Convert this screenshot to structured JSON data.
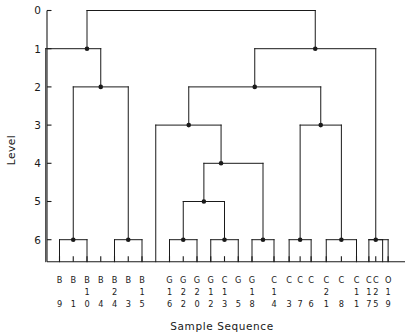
{
  "chart_data": {
    "type": "tree",
    "title": "",
    "xlabel": "Sample Sequence",
    "ylabel": "Level",
    "ylim": [
      0,
      6.6
    ],
    "y_ticks": [
      "0",
      "1",
      "2",
      "3",
      "4",
      "5",
      "6"
    ],
    "y_tick_values": [
      0,
      1,
      2,
      3,
      4,
      5,
      6
    ],
    "grid": false,
    "legend": "none",
    "orientation": "top-down",
    "leaf_count": 29,
    "leaves": [
      {
        "index": 0,
        "label": "B9",
        "letter": "B",
        "tens": "",
        "ones": "9"
      },
      {
        "index": 1,
        "label": "B1",
        "letter": "B",
        "tens": "",
        "ones": "1"
      },
      {
        "index": 2,
        "label": "B10",
        "letter": "B",
        "tens": "1",
        "ones": "0"
      },
      {
        "index": 3,
        "label": "B4",
        "letter": "B",
        "tens": "",
        "ones": "4"
      },
      {
        "index": 4,
        "label": "B24",
        "letter": "B",
        "tens": "2",
        "ones": "4"
      },
      {
        "index": 5,
        "label": "B3",
        "letter": "B",
        "tens": "",
        "ones": "3"
      },
      {
        "index": 6,
        "label": "B15",
        "letter": "B",
        "tens": "1",
        "ones": "5"
      },
      {
        "index": 7,
        "label": "G16",
        "letter": "G",
        "tens": "1",
        "ones": "6"
      },
      {
        "index": 8,
        "label": "G22",
        "letter": "G",
        "tens": "2",
        "ones": "2"
      },
      {
        "index": 9,
        "label": "G20",
        "letter": "G",
        "tens": "2",
        "ones": "0"
      },
      {
        "index": 10,
        "label": "G12",
        "letter": "G",
        "tens": "1",
        "ones": "2"
      },
      {
        "index": 11,
        "label": "C13",
        "letter": "C",
        "tens": "1",
        "ones": "3"
      },
      {
        "index": 12,
        "label": "G5",
        "letter": "G",
        "tens": "",
        "ones": "5"
      },
      {
        "index": 13,
        "label": "G18",
        "letter": "G",
        "tens": "1",
        "ones": "8"
      },
      {
        "index": 14,
        "label": "C14",
        "letter": "C",
        "tens": "1",
        "ones": "4"
      },
      {
        "index": 15,
        "label": "C3",
        "letter": "C",
        "tens": "",
        "ones": "3"
      },
      {
        "index": 16,
        "label": "C7",
        "letter": "C",
        "tens": "",
        "ones": "7"
      },
      {
        "index": 17,
        "label": "C6",
        "letter": "C",
        "tens": "",
        "ones": "6"
      },
      {
        "index": 18,
        "label": "C21",
        "letter": "C",
        "tens": "2",
        "ones": "1"
      },
      {
        "index": 19,
        "label": "C8",
        "letter": "C",
        "tens": "",
        "ones": "8"
      },
      {
        "index": 20,
        "label": "C11",
        "letter": "C",
        "tens": "1",
        "ones": "1"
      },
      {
        "index": 21,
        "label": "C17",
        "letter": "C",
        "tens": "1",
        "ones": "7"
      },
      {
        "index": 22,
        "label": "C25",
        "letter": "C",
        "tens": "2",
        "ones": "5"
      },
      {
        "index": 23,
        "label": "O19",
        "letter": "O",
        "tens": "1",
        "ones": "9"
      }
    ],
    "merges": [
      {
        "id": "m6a",
        "level": 6,
        "left_x": 0,
        "right_x": 2,
        "join_x": 1
      },
      {
        "id": "m6b",
        "level": 6,
        "left_x": 4,
        "right_x": 6,
        "join_x": 5
      },
      {
        "id": "m6c",
        "level": 6,
        "left_x": 8,
        "right_x": 10,
        "join_x": 9
      },
      {
        "id": "m6d",
        "level": 6,
        "left_x": 11,
        "right_x": 13,
        "join_x": 12
      },
      {
        "id": "m6e",
        "level": 6,
        "left_x": 14,
        "right_x": 15.6,
        "join_x": 14.8
      },
      {
        "id": "m6f",
        "level": 6,
        "left_x": 16.7,
        "right_x": 18.3,
        "join_x": 17.5
      },
      {
        "id": "m6g",
        "level": 6,
        "left_x": 19.4,
        "right_x": 21.6,
        "join_x": 20.5
      },
      {
        "id": "m6h",
        "level": 6,
        "left_x": 22.5,
        "right_x": 23.5,
        "join_x": 23
      }
    ],
    "internal_nodes": [
      {
        "id": "n5",
        "level": 5,
        "join_x": 16.15
      },
      {
        "id": "n4",
        "level": 4,
        "join_x": 15.48
      },
      {
        "id": "n3a",
        "level": 3,
        "join_x": 14.1
      },
      {
        "id": "n3b",
        "level": 3,
        "join_x": 21.75
      },
      {
        "id": "n2a",
        "level": 2,
        "join_x": 3.0
      },
      {
        "id": "n2b",
        "level": 2,
        "join_x": 17.9
      },
      {
        "id": "n1a",
        "level": 1,
        "join_x": 2.0
      },
      {
        "id": "n1b",
        "level": 1,
        "join_x": 20.45
      },
      {
        "id": "n0",
        "level": 0,
        "join_x": 11.2
      }
    ]
  },
  "axes": {
    "ylabel": "Level",
    "xlabel": "Sample Sequence"
  }
}
